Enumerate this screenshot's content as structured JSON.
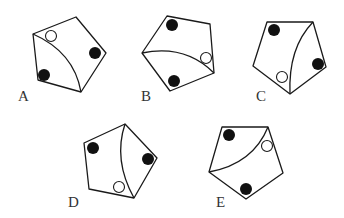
{
  "figure": {
    "type": "pentagon-option-set",
    "options": [
      {
        "label": "A",
        "label_pos": [
          18,
          101
        ],
        "pentagon": [
          [
            33,
            34
          ],
          [
            76,
            17
          ],
          [
            106,
            53
          ],
          [
            81,
            92
          ],
          [
            38,
            80
          ]
        ],
        "curve": {
          "from": [
            33,
            34
          ],
          "ctrl": [
            74,
            52
          ],
          "to": [
            81,
            92
          ]
        },
        "black_dots": [
          [
            95,
            53
          ],
          [
            44,
            75
          ]
        ],
        "open_dots": [
          [
            51,
            36
          ]
        ]
      },
      {
        "label": "B",
        "label_pos": [
          141,
          101
        ],
        "pentagon": [
          [
            167,
            16
          ],
          [
            210,
            24
          ],
          [
            214,
            73
          ],
          [
            170,
            91
          ],
          [
            142,
            53
          ]
        ],
        "curve": {
          "from": [
            142,
            53
          ],
          "ctrl": [
            185,
            44
          ],
          "to": [
            214,
            73
          ]
        },
        "black_dots": [
          [
            172,
            25
          ],
          [
            174,
            81
          ]
        ],
        "open_dots": [
          [
            206,
            58
          ]
        ]
      },
      {
        "label": "C",
        "label_pos": [
          256,
          101
        ],
        "pentagon": [
          [
            267,
            22
          ],
          [
            313,
            22
          ],
          [
            326,
            67
          ],
          [
            290,
            94
          ],
          [
            253,
            66
          ]
        ],
        "curve": {
          "from": [
            313,
            22
          ],
          "ctrl": [
            288,
            48
          ],
          "to": [
            290,
            94
          ]
        },
        "black_dots": [
          [
            274,
            30
          ],
          [
            318,
            64
          ]
        ],
        "open_dots": [
          [
            282,
            77
          ]
        ]
      },
      {
        "label": "D",
        "label_pos": [
          68,
          207
        ],
        "pentagon": [
          [
            84,
            143
          ],
          [
            125,
            124
          ],
          [
            157,
            158
          ],
          [
            134,
            198
          ],
          [
            89,
            189
          ]
        ],
        "curve": {
          "from": [
            125,
            124
          ],
          "ctrl": [
            113,
            160
          ],
          "to": [
            134,
            198
          ]
        },
        "black_dots": [
          [
            93,
            148
          ],
          [
            148,
            159
          ]
        ],
        "open_dots": [
          [
            119,
            187
          ]
        ]
      },
      {
        "label": "E",
        "label_pos": [
          216,
          207
        ],
        "pentagon": [
          [
            222,
            127
          ],
          [
            268,
            127
          ],
          [
            283,
            173
          ],
          [
            246,
            199
          ],
          [
            209,
            172
          ]
        ],
        "curve": {
          "from": [
            209,
            172
          ],
          "ctrl": [
            253,
            164
          ],
          "to": [
            268,
            127
          ]
        },
        "black_dots": [
          [
            229,
            135
          ],
          [
            246,
            189
          ]
        ],
        "open_dots": [
          [
            267,
            146
          ]
        ]
      }
    ],
    "dot_radius": 6
  }
}
